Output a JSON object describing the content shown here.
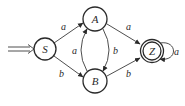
{
  "diagram": {
    "type": "finite-automaton",
    "initial_state": "S",
    "nodes": [
      {
        "id": "S",
        "label": "S",
        "accepting": false,
        "initial": true
      },
      {
        "id": "A",
        "label": "A",
        "accepting": false,
        "initial": false
      },
      {
        "id": "B",
        "label": "B",
        "accepting": false,
        "initial": false
      },
      {
        "id": "Z",
        "label": "Z",
        "accepting": true,
        "initial": false
      }
    ],
    "edges": [
      {
        "from": "S",
        "to": "A",
        "label": "a"
      },
      {
        "from": "S",
        "to": "B",
        "label": "b"
      },
      {
        "from": "A",
        "to": "Z",
        "label": "a"
      },
      {
        "from": "A",
        "to": "B",
        "label": "b"
      },
      {
        "from": "B",
        "to": "A",
        "label": "a"
      },
      {
        "from": "B",
        "to": "Z",
        "label": "b"
      },
      {
        "from": "Z",
        "to": "Z",
        "label": "a"
      }
    ]
  }
}
